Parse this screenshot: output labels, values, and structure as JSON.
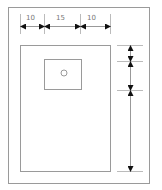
{
  "diagram": {
    "type": "technical-drawing",
    "colors": {
      "line": "#9a9a9a",
      "arrow": "#111111",
      "text": "#777777"
    },
    "horizontal_dimensions": [
      {
        "label": "10"
      },
      {
        "label": "15"
      },
      {
        "label": "10"
      }
    ],
    "vertical_dimensions": [
      {
        "label": ""
      },
      {
        "label": ""
      },
      {
        "label": ""
      }
    ],
    "elements": {
      "outer_frame": "outer-frame",
      "panel": "panel",
      "inner_box": "inner-box",
      "hole": "circle"
    }
  }
}
